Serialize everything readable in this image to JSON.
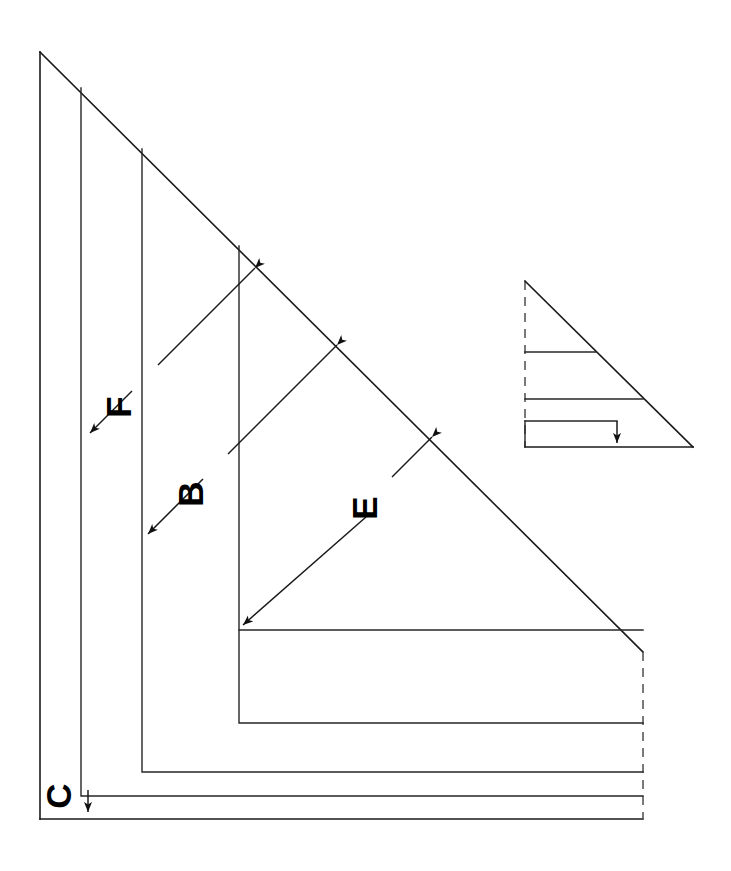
{
  "figure": {
    "kind": "engineering-line-drawing",
    "background_color": "#ffffff",
    "line_color": "#1a1a1a",
    "dashed_line_color": "#4d4d4d",
    "width": 731,
    "height": 871
  },
  "dimensions": [
    {
      "id": "F",
      "label": "F",
      "label_x": 122,
      "label_y": 407,
      "label_rotation": -90
    },
    {
      "id": "B",
      "label": "B",
      "label_x": 194,
      "label_y": 494,
      "label_rotation": -90
    },
    {
      "id": "E",
      "label": "E",
      "label_x": 368,
      "label_y": 508,
      "label_rotation": -90
    },
    {
      "id": "C",
      "label": "C",
      "label_x": 62,
      "label_y": 796,
      "label_rotation": -90
    }
  ],
  "main_view": {
    "apex": {
      "x": 40,
      "y": 52
    },
    "hypotenuse_end": {
      "x": 643,
      "y": 652
    },
    "bottom_left": {
      "x": 40,
      "y": 819
    },
    "vertical_edges_x": [
      40,
      81,
      142,
      239
    ],
    "horizontal_edges_y": [
      630,
      723,
      772,
      796,
      819
    ],
    "dashed_right_edge_x": 643
  },
  "inset_view": {
    "apex": {
      "x": 525,
      "y": 281
    },
    "bottom_left": {
      "x": 525,
      "y": 447
    },
    "bottom_right": {
      "x": 693,
      "y": 447
    },
    "internal_edges_y": [
      352,
      399,
      421
    ],
    "arrow_x": 617,
    "dashed_left_edge": true
  }
}
